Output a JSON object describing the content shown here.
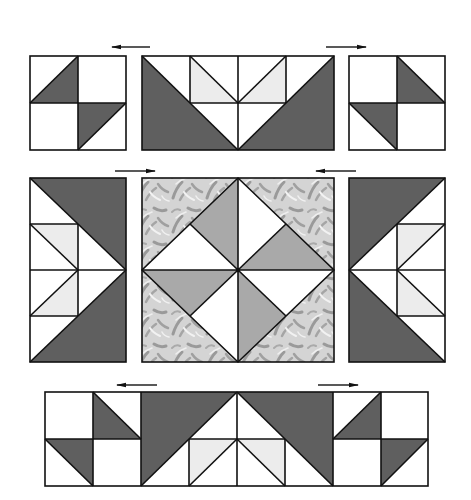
{
  "diagram": {
    "type": "quilt-block-assembly",
    "colors": {
      "background": "#ffffff",
      "dark": "#5f5f5f",
      "medium": "#a9a9a9",
      "light": "#ececec",
      "white": "#ffffff",
      "outline": "#111111",
      "fabric_base": "#d4d4d4",
      "fabric_motif": "#9a9a9a",
      "fabric_highlight": "#f2f2f2"
    },
    "rows": [
      {
        "name": "top-row",
        "units": [
          "top-left-four-patch",
          "top-flying-geese-unit",
          "top-right-four-patch"
        ],
        "arrows": [
          "left",
          "right"
        ]
      },
      {
        "name": "middle-row",
        "units": [
          "left-flying-geese-unit",
          "center-square-in-square",
          "right-flying-geese-unit"
        ],
        "arrows": [
          "right",
          "left"
        ]
      },
      {
        "name": "bottom-row",
        "units": [
          "bottom-assembled-strip"
        ],
        "arrows": [
          "left",
          "right"
        ]
      }
    ],
    "pressing_arrows": [
      {
        "id": "top-left-arrow",
        "direction": "left"
      },
      {
        "id": "top-right-arrow",
        "direction": "right"
      },
      {
        "id": "middle-left-arrow",
        "direction": "right"
      },
      {
        "id": "middle-right-arrow",
        "direction": "left"
      },
      {
        "id": "bottom-left-arrow",
        "direction": "left"
      },
      {
        "id": "bottom-right-arrow",
        "direction": "right"
      }
    ]
  }
}
